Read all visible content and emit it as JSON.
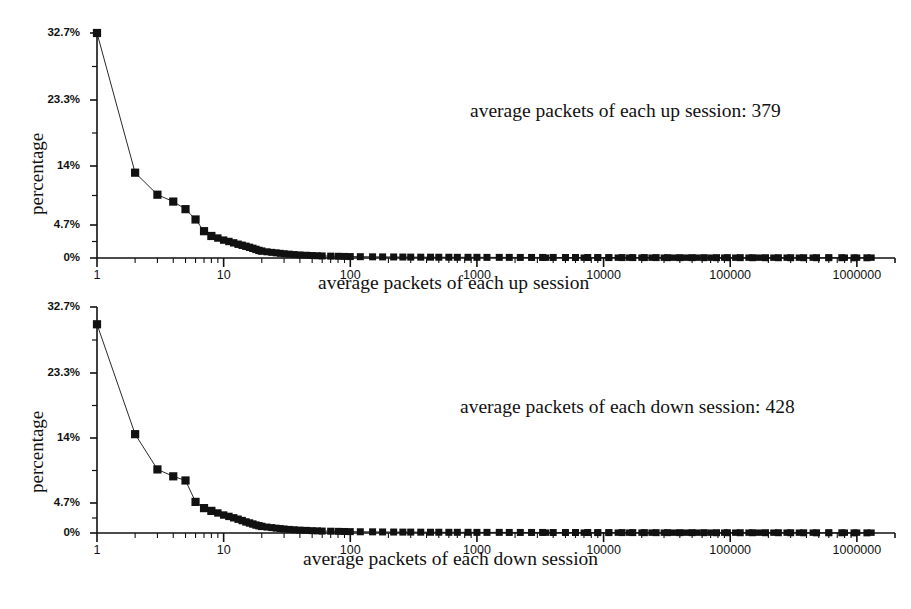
{
  "chart_data": [
    {
      "id": "up",
      "type": "scatter",
      "title": "",
      "xlabel": "average packets of each up session",
      "ylabel": "percentage",
      "xscale": "log",
      "xlim": [
        1,
        2000000
      ],
      "ylim": [
        0,
        32.7
      ],
      "grid": false,
      "legend": "none",
      "annotation": "average packets of each up session: 379",
      "xtick_labels": [
        "1",
        "10",
        "100",
        "1000",
        "10000",
        "100000",
        "1000000"
      ],
      "xtick_values": [
        1,
        10,
        100,
        1000,
        10000,
        100000,
        1000000
      ],
      "ytick_labels": [
        "0%",
        "4.7%",
        "14%",
        "23.3%",
        "32.7%"
      ],
      "ytick_values": [
        0,
        4.7,
        14,
        23.3,
        32.7
      ],
      "marker": "filled-square",
      "line": "thin-solid",
      "x": [
        1,
        2,
        3,
        4,
        5,
        6,
        7,
        8,
        9,
        10,
        11,
        12,
        13,
        14,
        15,
        16,
        17,
        18,
        19,
        20,
        22,
        24,
        26,
        28,
        30,
        33,
        36,
        40,
        45,
        50,
        55,
        60,
        70,
        80,
        90,
        100,
        120,
        150,
        180,
        220,
        260,
        300,
        360,
        430,
        500,
        600,
        700,
        850,
        1000,
        1200,
        1500,
        1800,
        2200,
        2700,
        3300,
        4000,
        5000,
        6000,
        7500,
        9000,
        11000,
        14000,
        17000,
        21000,
        26000,
        32000,
        40000,
        50000,
        62000,
        78000,
        95000,
        120000,
        150000,
        190000,
        240000,
        300000,
        380000,
        480000,
        600000,
        760000,
        950000,
        1200000
      ],
      "y": [
        32.7,
        12.4,
        9.2,
        8.2,
        7.1,
        5.6,
        3.9,
        3.2,
        2.9,
        2.6,
        2.4,
        2.2,
        2.0,
        1.85,
        1.7,
        1.55,
        1.4,
        1.25,
        1.1,
        1.0,
        0.9,
        0.82,
        0.75,
        0.68,
        0.62,
        0.56,
        0.5,
        0.45,
        0.4,
        0.36,
        0.33,
        0.3,
        0.27,
        0.25,
        0.23,
        0.21,
        0.19,
        0.17,
        0.16,
        0.15,
        0.14,
        0.13,
        0.12,
        0.12,
        0.11,
        0.11,
        0.1,
        0.1,
        0.1,
        0.09,
        0.09,
        0.09,
        0.08,
        0.08,
        0.08,
        0.08,
        0.07,
        0.07,
        0.07,
        0.07,
        0.06,
        0.06,
        0.06,
        0.06,
        0.06,
        0.05,
        0.05,
        0.05,
        0.05,
        0.05,
        0.05,
        0.05,
        0.04,
        0.04,
        0.04,
        0.04,
        0.04,
        0.04,
        0.04,
        0.04,
        0.03,
        0.03
      ]
    },
    {
      "id": "down",
      "type": "scatter",
      "title": "",
      "xlabel": "average packets of each down session",
      "ylabel": "percentage",
      "xscale": "log",
      "xlim": [
        1,
        2000000
      ],
      "ylim": [
        0,
        32.7
      ],
      "grid": false,
      "legend": "none",
      "annotation": "average packets of each down session: 428",
      "xtick_labels": [
        "1",
        "10",
        "100",
        "1000",
        "10000",
        "100000",
        "1000000"
      ],
      "xtick_values": [
        1,
        10,
        100,
        1000,
        10000,
        100000,
        1000000
      ],
      "ytick_labels": [
        "0%",
        "4.7%",
        "14%",
        "23.3%",
        "32.7%"
      ],
      "ytick_values": [
        0,
        4.7,
        14,
        23.3,
        32.7
      ],
      "marker": "filled-square",
      "line": "thin-solid",
      "x": [
        1,
        2,
        3,
        4,
        5,
        6,
        7,
        8,
        9,
        10,
        11,
        12,
        13,
        14,
        15,
        16,
        17,
        18,
        19,
        20,
        22,
        24,
        26,
        28,
        30,
        33,
        36,
        40,
        45,
        50,
        55,
        60,
        70,
        80,
        90,
        100,
        120,
        150,
        180,
        220,
        260,
        300,
        360,
        430,
        500,
        600,
        700,
        850,
        1000,
        1200,
        1500,
        1800,
        2200,
        2700,
        3300,
        4000,
        5000,
        6000,
        7500,
        9000,
        11000,
        14000,
        17000,
        21000,
        26000,
        32000,
        40000,
        50000,
        62000,
        78000,
        95000,
        120000,
        150000,
        190000,
        240000,
        300000,
        380000,
        480000,
        600000,
        760000,
        950000,
        1200000
      ],
      "y": [
        30.2,
        14.3,
        9.2,
        8.2,
        7.6,
        4.5,
        3.6,
        3.2,
        2.9,
        2.6,
        2.4,
        2.2,
        2.0,
        1.8,
        1.6,
        1.45,
        1.3,
        1.15,
        1.05,
        0.95,
        0.86,
        0.78,
        0.7,
        0.64,
        0.58,
        0.52,
        0.47,
        0.42,
        0.38,
        0.34,
        0.31,
        0.28,
        0.26,
        0.24,
        0.22,
        0.2,
        0.18,
        0.17,
        0.15,
        0.14,
        0.13,
        0.13,
        0.12,
        0.11,
        0.11,
        0.1,
        0.1,
        0.1,
        0.09,
        0.09,
        0.09,
        0.08,
        0.08,
        0.08,
        0.08,
        0.07,
        0.07,
        0.07,
        0.07,
        0.06,
        0.06,
        0.06,
        0.06,
        0.05,
        0.05,
        0.05,
        0.05,
        0.05,
        0.05,
        0.04,
        0.04,
        0.04,
        0.04,
        0.04,
        0.04,
        0.04,
        0.03,
        0.03,
        0.03,
        0.03,
        0.02,
        0.02
      ]
    }
  ],
  "figure": {
    "background": "#ffffff",
    "ink": "#111111"
  },
  "panels": {
    "up": {
      "ylabel": "percentage",
      "xlabel": "average packets of each up session",
      "annotation": "average packets of each up session: 379",
      "ytick_labels": [
        "32.7%",
        "23.3%",
        "14%",
        "4.7%",
        "0%"
      ],
      "xtick_labels": [
        "1",
        "10",
        "100",
        "1000",
        "10000",
        "100000",
        "1000000"
      ]
    },
    "down": {
      "ylabel": "percentage",
      "xlabel": "average packets of each down session",
      "annotation": "average packets of each down session: 428",
      "ytick_labels": [
        "32.7%",
        "23.3%",
        "14%",
        "4.7%",
        "0%"
      ],
      "xtick_labels": [
        "1",
        "10",
        "100",
        "1000",
        "10000",
        "100000",
        "1000000"
      ]
    }
  }
}
